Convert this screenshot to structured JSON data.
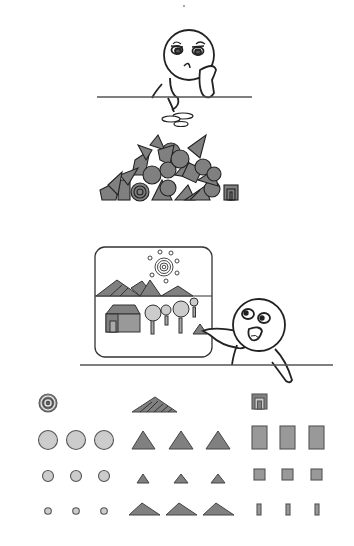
{
  "illustration": {
    "title": "",
    "panels": [
      {
        "name": "bored-character",
        "description": "Bored character leaning on table with spilled shapes"
      },
      {
        "name": "shape-pile",
        "description": "Jumbled pile of geometric shapes"
      },
      {
        "name": "excited-character-with-picture",
        "description": "Excited character pointing at picture composed of shapes"
      },
      {
        "name": "sorted-shapes",
        "description": "Shapes sorted into rows and columns"
      }
    ],
    "colors": {
      "stroke": "#222222",
      "dark_fill": "#808080",
      "light_fill": "#cccccc",
      "line": "#555555"
    },
    "sorted_shapes": {
      "circles": {
        "rows": [
          1,
          3,
          3,
          3
        ]
      },
      "triangles": {
        "rows": [
          1,
          3,
          3,
          3
        ]
      },
      "rectangles": {
        "rows": [
          1,
          3,
          3,
          3
        ]
      }
    }
  }
}
